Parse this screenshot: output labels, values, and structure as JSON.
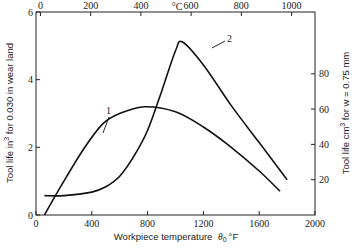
{
  "chart_data": {
    "type": "line",
    "title": "",
    "xlabel": "Workpiece temperature θ0 °F",
    "x2label": "°C",
    "ylabel": "Tool life in³ for 0.030 in wear land",
    "y2label": "Tool life cm³ for w = 0.75 mm",
    "xlim": [
      0,
      2000
    ],
    "ylim": [
      0,
      6
    ],
    "x2lim": [
      0,
      1093
    ],
    "y2lim": [
      0,
      115
    ],
    "x_ticks": [
      0,
      400,
      800,
      1200,
      1600,
      2000
    ],
    "x2_ticks": [
      0,
      200,
      400,
      600,
      800,
      1000
    ],
    "y_ticks": [
      0,
      2,
      4,
      6
    ],
    "y2_ticks": [
      20,
      40,
      60,
      80
    ],
    "grid": false,
    "legend": "inline curve labels 1 and 2",
    "series": [
      {
        "name": "1",
        "axis": "left",
        "x": [
          60,
          200,
          350,
          480,
          600,
          780,
          1000,
          1200,
          1400,
          1600,
          1750
        ],
        "y": [
          0.0,
          1.0,
          2.0,
          2.7,
          3.0,
          3.2,
          3.05,
          2.6,
          2.0,
          1.3,
          0.7
        ]
      },
      {
        "name": "2",
        "axis": "right",
        "x": [
          60,
          200,
          400,
          500,
          600,
          700,
          800,
          900,
          1000,
          1050,
          1200,
          1400,
          1600,
          1800
        ],
        "y": [
          11,
          11,
          13,
          16,
          22,
          33,
          48,
          70,
          93,
          98,
          85,
          62,
          41,
          20
        ]
      }
    ],
    "annotations": [
      {
        "text": "1",
        "x": 480,
        "y": 3.4
      },
      {
        "text": "2",
        "x": 1280,
        "y": 5.5
      }
    ]
  },
  "labels": {
    "x_title": "Workpiece temperature",
    "x_symbol": "θ",
    "x_sub": "0",
    "x_unit": "°F",
    "top_unit": "°C",
    "y_title": "Tool life in",
    "y_sup": "3",
    "y_rest": " for 0.030 in wear land",
    "y2_title": "Tool life cm",
    "y2_sup": "3",
    "y2_rest": " for w = 0.75 mm",
    "curve1": "1",
    "curve2": "2"
  }
}
